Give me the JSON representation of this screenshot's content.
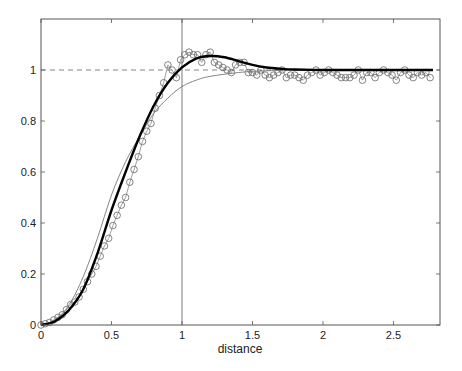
{
  "chart_data": {
    "type": "line",
    "title": "",
    "xlabel": "distance",
    "ylabel": "",
    "xlim": [
      0,
      2.83
    ],
    "ylim": [
      0,
      1.2
    ],
    "grid": false,
    "legend": null,
    "x_ticks": [
      0,
      0.5,
      1,
      1.5,
      2,
      2.5
    ],
    "x_tick_labels": [
      "0",
      "0.5",
      "1",
      "1.5",
      "2",
      "2.5"
    ],
    "y_ticks": [
      0,
      0.2,
      0.4,
      0.6,
      0.8,
      1
    ],
    "y_tick_labels": [
      "0",
      "0.2",
      "0.4",
      "0.6",
      "0.8",
      "1"
    ],
    "reference_lines": {
      "horizontal_dashed_y": 1,
      "vertical_x": 1
    },
    "series": [
      {
        "name": "thick-fit",
        "style": "thick-solid",
        "x": [
          0,
          0.1,
          0.2,
          0.3,
          0.4,
          0.5,
          0.6,
          0.7,
          0.8,
          0.9,
          1.0,
          1.1,
          1.2,
          1.3,
          1.4,
          1.5,
          1.6,
          1.7,
          1.8,
          2.0,
          2.2,
          2.78
        ],
        "y": [
          0,
          0.015,
          0.06,
          0.14,
          0.28,
          0.45,
          0.6,
          0.74,
          0.86,
          0.95,
          1.01,
          1.045,
          1.055,
          1.05,
          1.035,
          1.02,
          1.01,
          1.005,
          1.002,
          1.0,
          1.0,
          1.0
        ]
      },
      {
        "name": "thin-model",
        "style": "thin-solid",
        "x": [
          0,
          0.1,
          0.2,
          0.3,
          0.4,
          0.5,
          0.6,
          0.7,
          0.8,
          0.9,
          1.0,
          1.1,
          1.2,
          1.4,
          1.6,
          2.0,
          2.78
        ],
        "y": [
          0,
          0.02,
          0.08,
          0.19,
          0.34,
          0.51,
          0.64,
          0.74,
          0.83,
          0.89,
          0.935,
          0.96,
          0.975,
          0.99,
          0.997,
          1.0,
          1.0
        ]
      },
      {
        "name": "data-points",
        "style": "circles-thin-line",
        "x_start": 0,
        "x_step": 0.03,
        "y": [
          0,
          0.005,
          0.01,
          0.02,
          0.03,
          0.04,
          0.06,
          0.08,
          0.09,
          0.11,
          0.14,
          0.17,
          0.2,
          0.23,
          0.27,
          0.31,
          0.34,
          0.39,
          0.43,
          0.47,
          0.5,
          0.56,
          0.61,
          0.66,
          0.72,
          0.76,
          0.79,
          0.85,
          0.9,
          0.95,
          1.02,
          1.0,
          0.97,
          1.04,
          1.06,
          1.07,
          1.06,
          1.06,
          1.03,
          1.06,
          1.07,
          1.03,
          1.02,
          1.01,
          1.0,
          0.99,
          1.02,
          1.03,
          1.03,
          0.99,
          0.99,
          0.98,
          1.0,
          0.98,
          0.97,
          0.98,
          0.99,
          1.0,
          0.97,
          0.98,
          0.98,
          0.97,
          0.96,
          0.98,
          0.99,
          1.0,
          0.98,
          0.99,
          1.0,
          0.99,
          0.98,
          0.97,
          0.97,
          0.97,
          0.98,
          1.0,
          0.96,
          0.99,
          0.99,
          0.97,
          0.99,
          1.0,
          0.99,
          0.98,
          0.96,
          0.99,
          1.0,
          0.98,
          0.97,
          0.99,
          0.98,
          0.99,
          0.97
        ]
      }
    ]
  }
}
